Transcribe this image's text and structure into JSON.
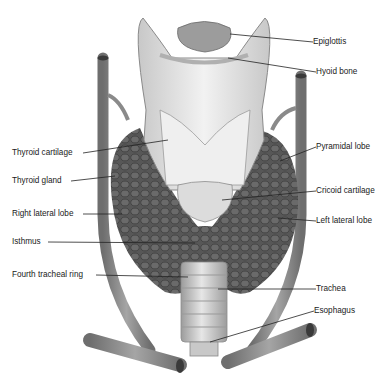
{
  "figure": {
    "colors": {
      "background": "#ffffff",
      "gland": "#555555",
      "gland_dark": "#3f3f3f",
      "cartilage": "#e2e2e2",
      "vessel": "#8a8a8a",
      "label_line": "#222222",
      "text": "#1a1a1a"
    }
  },
  "labels": {
    "left": [
      {
        "text": "Thyroid cartilage",
        "x": 12,
        "y": 148
      },
      {
        "text": "Thyroid gland",
        "x": 12,
        "y": 176
      },
      {
        "text": "Right lateral lobe",
        "x": 12,
        "y": 209
      },
      {
        "text": "Isthmus",
        "x": 12,
        "y": 237
      },
      {
        "text": "Fourth tracheal ring",
        "x": 12,
        "y": 270
      }
    ],
    "right": [
      {
        "text": "Epiglottis",
        "x": 313,
        "y": 37
      },
      {
        "text": "Hyoid bone",
        "x": 316,
        "y": 67
      },
      {
        "text": "Pyramidal lobe",
        "x": 316,
        "y": 142
      },
      {
        "text": "Cricoid cartilage",
        "x": 316,
        "y": 186
      },
      {
        "text": "Left lateral lobe",
        "x": 316,
        "y": 216
      },
      {
        "text": "Trachea",
        "x": 316,
        "y": 284
      },
      {
        "text": "Esophagus",
        "x": 314,
        "y": 306
      }
    ]
  }
}
